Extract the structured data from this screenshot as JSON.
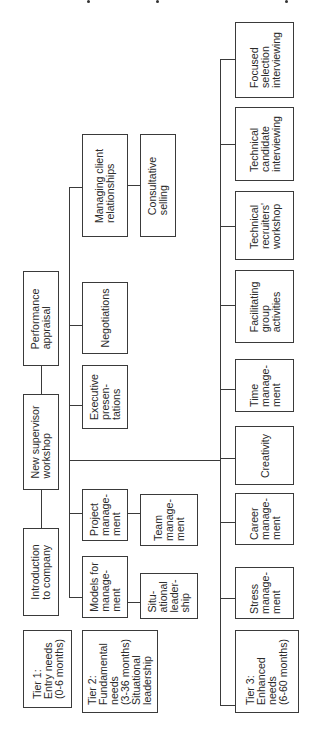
{
  "header": {
    "note": "Top caption text is cut off at image edge (only descenders visible)"
  },
  "tier1": {
    "label": "Tier 1:\nEntry needs\n(0-6 months)",
    "courses": [
      {
        "label": "Introduction\nto company"
      },
      {
        "label": "New supervisor\nworkshop"
      },
      {
        "label": "Performance\nappraisal"
      }
    ]
  },
  "tier2": {
    "label": "Tier 2:\nFundamental\nneeds\n(3-36 months)\nSituational\nleadership",
    "courses": [
      {
        "label": "Models for\nmanage-\nment",
        "sub": "Situ-\national\nleader-\nship"
      },
      {
        "label": "Project\nmanage-\nment",
        "sub": "Team\nmanage-\nment"
      },
      {
        "label": "Executive\npresen-\ntations"
      },
      {
        "label": "Negotiations"
      },
      {
        "label": "Managing client\nrelationships",
        "sub": "Consultative\nselling"
      }
    ]
  },
  "tier3": {
    "label": "Tier 3:\nEnhanced\nneeds\n(6-60 months)",
    "courses": [
      {
        "label": "Stress\nmanage-\nment"
      },
      {
        "label": "Career\nmanage-\nment"
      },
      {
        "label": "Creativity"
      },
      {
        "label": "Time\nmanage-\nment"
      },
      {
        "label": "Facilitating\ngroup\nactivities"
      },
      {
        "label": "Technical\nrecruiters'\nworkshop"
      },
      {
        "label": "Technical\ncandidate\ninterviewing"
      },
      {
        "label": "Focused\nselection\ninterviewing"
      }
    ]
  }
}
